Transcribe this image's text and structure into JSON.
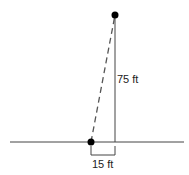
{
  "diagram": {
    "height_label": "75 ft",
    "base_label": "15 ft",
    "colors": {
      "line": "#333333",
      "dot": "#000000"
    }
  }
}
